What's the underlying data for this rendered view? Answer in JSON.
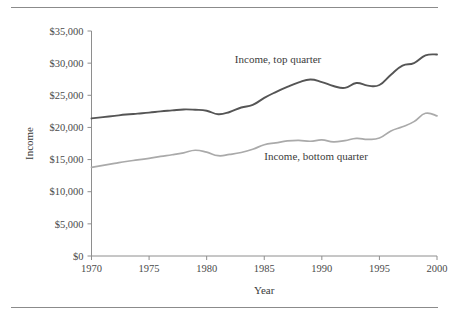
{
  "figure": {
    "has_top_rule": true,
    "has_bottom_rule": true,
    "rule_color": "#8b8b8b",
    "background": "#ffffff"
  },
  "chart_data": {
    "type": "line",
    "title": "",
    "xlabel": "Year",
    "ylabel": "Income",
    "xlim": [
      1970,
      2000
    ],
    "ylim": [
      0,
      35000
    ],
    "grid": false,
    "legend_position": "inline-annotation",
    "xticks": [
      1970,
      1975,
      1980,
      1985,
      1990,
      1995,
      2000
    ],
    "xtick_labels": [
      "1970",
      "1975",
      "1980",
      "1985",
      "1990",
      "1995",
      "2000"
    ],
    "yticks": [
      0,
      5000,
      10000,
      15000,
      20000,
      25000,
      30000,
      35000
    ],
    "ytick_labels": [
      "$0",
      "$5,000",
      "$10,000",
      "$15,000",
      "$20,000",
      "$25,000",
      "$30,000",
      "$35,000"
    ],
    "x": [
      1970,
      1971,
      1972,
      1973,
      1974,
      1975,
      1976,
      1977,
      1978,
      1979,
      1980,
      1981,
      1982,
      1983,
      1984,
      1985,
      1986,
      1987,
      1988,
      1989,
      1990,
      1991,
      1992,
      1993,
      1994,
      1995,
      1996,
      1997,
      1998,
      1999,
      2000
    ],
    "series": [
      {
        "name": "Income, top quarter",
        "color": "#555555",
        "width": 1.9,
        "label_x": 1986.2,
        "label_y": 30100,
        "values": [
          21400,
          21600,
          21800,
          22000,
          22150,
          22300,
          22500,
          22650,
          22800,
          22750,
          22600,
          22050,
          22400,
          23100,
          23500,
          24600,
          25500,
          26300,
          27000,
          27450,
          27050,
          26450,
          26150,
          26900,
          26500,
          26600,
          28200,
          29600,
          30000,
          31200,
          31350
        ]
      },
      {
        "name": "Income, bottom quarter",
        "color": "#aaaaaa",
        "width": 1.7,
        "label_x": 1989.5,
        "label_y": 14950,
        "values": [
          13800,
          14100,
          14400,
          14700,
          14950,
          15200,
          15500,
          15750,
          16050,
          16450,
          16150,
          15600,
          15800,
          16100,
          16600,
          17300,
          17600,
          17900,
          18000,
          17850,
          18050,
          17750,
          17950,
          18300,
          18150,
          18350,
          19450,
          20100,
          20900,
          22200,
          21800
        ]
      }
    ]
  }
}
